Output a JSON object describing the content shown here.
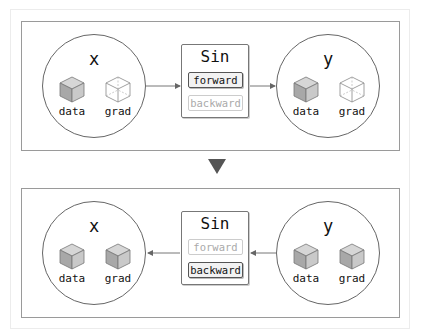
{
  "diagram": {
    "top_panel": {
      "input_variable": {
        "name": "x",
        "data_label": "data",
        "grad_label": "grad",
        "data_state": "filled",
        "grad_state": "empty"
      },
      "function": {
        "name": "Sin",
        "forward_label": "forward",
        "backward_label": "backward",
        "active": "forward"
      },
      "output_variable": {
        "name": "y",
        "data_label": "data",
        "grad_label": "grad",
        "data_state": "filled",
        "grad_state": "empty"
      },
      "flow_direction": "x -> Sin -> y"
    },
    "transition_arrow": "down-triangle",
    "bottom_panel": {
      "input_variable": {
        "name": "x",
        "data_label": "data",
        "grad_label": "grad",
        "data_state": "filled",
        "grad_state": "filled"
      },
      "function": {
        "name": "Sin",
        "forward_label": "forward",
        "backward_label": "backward",
        "active": "backward"
      },
      "output_variable": {
        "name": "y",
        "data_label": "data",
        "grad_label": "grad",
        "data_state": "filled",
        "grad_state": "filled"
      },
      "flow_direction": "y -> Sin -> x"
    },
    "colors": {
      "frame_border": "#9a9a9a",
      "cube_fill_top": "#d4d4d4",
      "cube_fill_left": "#a9a9a9",
      "cube_fill_right": "#c8c8c8",
      "arrow": "#555555",
      "inactive_text": "#aaaaaa"
    }
  }
}
